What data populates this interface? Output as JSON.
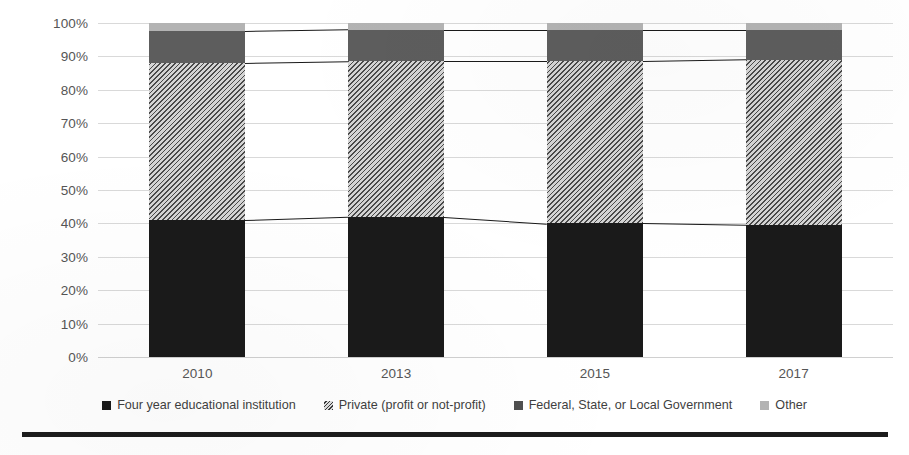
{
  "chart_data": {
    "type": "bar",
    "subtype": "stacked-100-percent",
    "title": "",
    "xlabel": "",
    "ylabel": "",
    "categories": [
      "2010",
      "2013",
      "2015",
      "2017"
    ],
    "ylim": [
      0,
      100
    ],
    "ytick_labels": [
      "0%",
      "10%",
      "20%",
      "30%",
      "40%",
      "50%",
      "60%",
      "70%",
      "80%",
      "90%",
      "100%"
    ],
    "ytick_values": [
      0,
      10,
      20,
      30,
      40,
      50,
      60,
      70,
      80,
      90,
      100
    ],
    "grid": true,
    "legend_position": "bottom",
    "series": [
      {
        "name": "Four year educational institution",
        "color": "#1a1a1a",
        "pattern": "solid",
        "values": [
          41,
          42,
          40,
          39.5
        ]
      },
      {
        "name": "Private (profit or not-profit)",
        "color": "#d4d4d4",
        "pattern": "diagonal-hatch",
        "values": [
          47,
          46.5,
          48.5,
          49.5
        ]
      },
      {
        "name": "Federal, State, or Local Government",
        "color": "#5d5d5d",
        "pattern": "solid",
        "values": [
          9.5,
          9.5,
          9.5,
          9
        ]
      },
      {
        "name": "Other",
        "color": "#b3b3b3",
        "pattern": "solid",
        "values": [
          2.5,
          2,
          2,
          2
        ]
      }
    ]
  },
  "legend": {
    "items": [
      {
        "label": "Four year educational institution",
        "swatch": "sw-four-year"
      },
      {
        "label": "Private (profit or not-profit)",
        "swatch": "sw-private"
      },
      {
        "label": "Federal, State, or Local Government",
        "swatch": "sw-government"
      },
      {
        "label": "Other",
        "swatch": "sw-other"
      }
    ]
  }
}
